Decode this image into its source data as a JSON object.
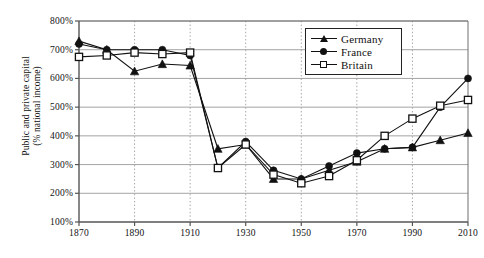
{
  "figure": {
    "ylabel_line1": "Public and private capital",
    "ylabel_line2": "(% national income)"
  },
  "legend": {
    "position": "top-right-inside",
    "items": [
      {
        "label": "Germany",
        "marker": "triangle",
        "color": "#111111"
      },
      {
        "label": "France",
        "marker": "filled-circle",
        "color": "#111111"
      },
      {
        "label": "Britain",
        "marker": "open-square",
        "color": "#111111"
      }
    ]
  },
  "chart_data": {
    "type": "line",
    "title": "",
    "subtitle": "",
    "xlabel": "",
    "ylabel": "Public and private capital (% national income)",
    "xlim": [
      1870,
      2010
    ],
    "ylim": [
      100,
      800
    ],
    "ytick_labels": [
      "100%",
      "200%",
      "300%",
      "400%",
      "500%",
      "600%",
      "700%",
      "800%"
    ],
    "ytick_values": [
      100,
      200,
      300,
      400,
      500,
      600,
      700,
      800
    ],
    "xtick_labels": [
      "1870",
      "1890",
      "1910",
      "1930",
      "1950",
      "1970",
      "1990",
      "2010"
    ],
    "xtick_values": [
      1870,
      1890,
      1910,
      1930,
      1950,
      1970,
      1990,
      2010
    ],
    "x": [
      1870,
      1880,
      1890,
      1900,
      1910,
      1920,
      1930,
      1940,
      1950,
      1960,
      1970,
      1980,
      1990,
      2000,
      2010
    ],
    "grid": "horizontal-solid-and-vertical-dotted",
    "series": [
      {
        "name": "Germany",
        "marker": "triangle",
        "color": "#111111",
        "values": [
          730,
          700,
          625,
          650,
          645,
          355,
          370,
          250,
          250,
          280,
          310,
          355,
          360,
          385,
          410
        ]
      },
      {
        "name": "France",
        "marker": "filled-circle",
        "color": "#111111",
        "values": [
          720,
          700,
          700,
          700,
          680,
          288,
          380,
          280,
          250,
          295,
          340,
          355,
          360,
          500,
          600
        ]
      },
      {
        "name": "Britain",
        "marker": "open-square",
        "color": "#111111",
        "values": [
          675,
          680,
          690,
          685,
          690,
          288,
          370,
          265,
          235,
          260,
          315,
          400,
          460,
          505,
          525
        ]
      }
    ]
  }
}
